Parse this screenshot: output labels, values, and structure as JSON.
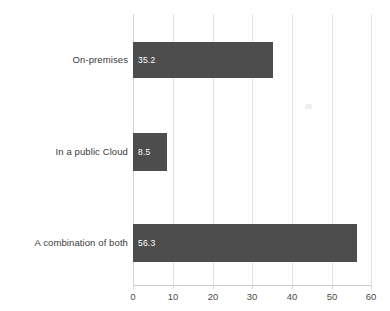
{
  "chart_data": {
    "type": "bar",
    "orientation": "horizontal",
    "title": "",
    "subtitle": "",
    "xlabel": "",
    "ylabel": "",
    "categories": [
      "On-premises",
      "In a public Cloud",
      "A combination of both"
    ],
    "values": [
      35.2,
      8.5,
      56.3
    ],
    "value_labels": [
      "35.2",
      "8.5",
      "56.3"
    ],
    "series": [
      {
        "name": "",
        "values": [
          35.2,
          8.5,
          56.3
        ]
      }
    ],
    "xlim": [
      0,
      60
    ],
    "x_ticks": [
      0,
      10,
      20,
      30,
      40,
      50,
      60
    ],
    "x_tick_labels": [
      "0",
      "10",
      "20",
      "30",
      "40",
      "50",
      "60"
    ],
    "grid": true,
    "grid_axis": "x",
    "legend": false,
    "legend_position": "none",
    "annotations": [],
    "colors": {
      "bar_fill": "#4d4d4d",
      "value_label": "#ffffff",
      "category_label": "#3a3a3a",
      "tick_label": "#4a4a4a",
      "gridline": "#e3e3e3",
      "axis_line": "#c9c9c9",
      "background": "#ffffff"
    }
  }
}
